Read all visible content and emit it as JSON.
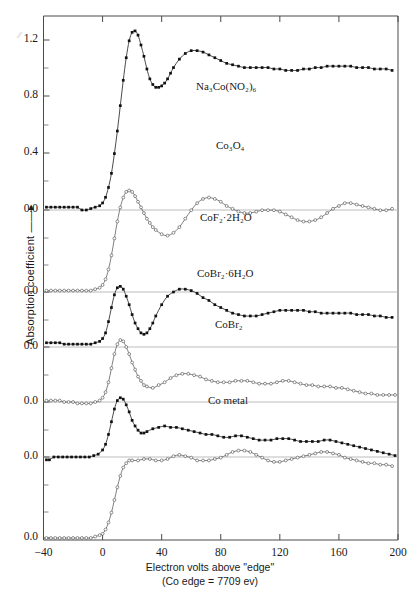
{
  "figure": {
    "axis_label_y": "Absorption coefficient ——▸",
    "axis_label_x_line1": "Electron volts above \"edge\"",
    "axis_label_x_line2": "(Co edge = 7709 ev)"
  },
  "chart_data": {
    "type": "line",
    "title": "",
    "xlabel": "Electron volts above \"edge\"",
    "ylabel": "Absorption coefficient",
    "xlim": [
      -40,
      200
    ],
    "ylim": [
      0.0,
      1.4
    ],
    "xticks": [
      -40,
      0,
      40,
      80,
      120,
      160,
      200
    ],
    "xticklabels": [
      "−40",
      "0",
      "40",
      "80",
      "120",
      "160",
      "200"
    ],
    "yticklabels": [
      "1.2",
      "0.8",
      "0.4",
      "0.0",
      "0.0",
      "0.0",
      "0.0",
      "0.0",
      "0.0"
    ],
    "y_minor_tick_step": 0.2,
    "grid": "horizontal-baselines-only",
    "legend": "inline-annotations",
    "note": "Six XANES/EXAFS absorption spectra vertically offset; each curve has its own 0.0 baseline.",
    "series": [
      {
        "name": "Na3Co(NO2)6",
        "label": "Na₃Co(NO₂)₆",
        "marker": "filled-square",
        "baseline_value": 0.0,
        "x": [
          -38,
          -35,
          -32,
          -29,
          -26,
          -23,
          -20,
          -17,
          -14,
          -11,
          -8,
          -5,
          -2,
          0,
          2,
          4,
          6,
          8,
          10,
          12,
          14,
          16,
          18,
          20,
          22,
          24,
          26,
          28,
          30,
          32,
          34,
          36,
          38,
          40,
          42,
          44,
          46,
          48,
          52,
          56,
          60,
          64,
          68,
          72,
          76,
          80,
          84,
          88,
          92,
          96,
          100,
          104,
          108,
          112,
          116,
          120,
          124,
          128,
          132,
          136,
          140,
          144,
          148,
          152,
          156,
          160,
          164,
          168,
          172,
          176,
          180,
          184,
          188,
          192,
          196
        ],
        "y": [
          0.02,
          0.02,
          0.02,
          0.02,
          0.02,
          0.02,
          0.02,
          0.02,
          0.0,
          0.0,
          0.01,
          0.02,
          0.03,
          0.05,
          0.09,
          0.16,
          0.26,
          0.4,
          0.56,
          0.74,
          0.92,
          1.08,
          1.2,
          1.26,
          1.27,
          1.24,
          1.17,
          1.09,
          1.0,
          0.93,
          0.89,
          0.87,
          0.87,
          0.88,
          0.9,
          0.93,
          0.97,
          1.01,
          1.07,
          1.11,
          1.13,
          1.13,
          1.12,
          1.1,
          1.08,
          1.06,
          1.04,
          1.03,
          1.02,
          1.01,
          1.01,
          1.01,
          1.01,
          1.01,
          1.0,
          1.0,
          0.99,
          0.99,
          0.99,
          1.0,
          1.0,
          1.01,
          1.01,
          1.02,
          1.02,
          1.02,
          1.02,
          1.02,
          1.01,
          1.01,
          1.01,
          1.0,
          1.0,
          1.0,
          0.99
        ]
      },
      {
        "name": "Co3O4",
        "label": "Co₃O₄",
        "marker": "open-circle",
        "baseline_value": 0.0,
        "x": [
          -38,
          -35,
          -32,
          -29,
          -26,
          -23,
          -20,
          -17,
          -14,
          -11,
          -8,
          -5,
          -2,
          0,
          2,
          4,
          6,
          8,
          10,
          12,
          14,
          16,
          18,
          20,
          22,
          24,
          26,
          28,
          30,
          32,
          34,
          36,
          40,
          44,
          48,
          52,
          56,
          60,
          64,
          68,
          72,
          76,
          80,
          84,
          88,
          92,
          96,
          100,
          104,
          108,
          112,
          116,
          120,
          124,
          128,
          132,
          136,
          140,
          144,
          148,
          152,
          156,
          160,
          164,
          168,
          172,
          176,
          180,
          184,
          188,
          192,
          196
        ],
        "y": [
          0.01,
          0.01,
          0.01,
          0.01,
          0.01,
          0.01,
          0.01,
          0.01,
          0.01,
          0.01,
          0.01,
          0.02,
          0.03,
          0.05,
          0.09,
          0.16,
          0.26,
          0.38,
          0.5,
          0.6,
          0.67,
          0.71,
          0.72,
          0.71,
          0.68,
          0.64,
          0.6,
          0.56,
          0.52,
          0.49,
          0.46,
          0.44,
          0.41,
          0.4,
          0.42,
          0.46,
          0.52,
          0.58,
          0.63,
          0.66,
          0.67,
          0.66,
          0.64,
          0.61,
          0.59,
          0.57,
          0.56,
          0.56,
          0.57,
          0.58,
          0.58,
          0.58,
          0.57,
          0.55,
          0.53,
          0.51,
          0.5,
          0.5,
          0.51,
          0.53,
          0.56,
          0.59,
          0.61,
          0.63,
          0.63,
          0.62,
          0.61,
          0.6,
          0.59,
          0.58,
          0.58,
          0.59
        ]
      },
      {
        "name": "CoF2-2H2O",
        "label": "CoF₂·2H₂O",
        "marker": "filled-square",
        "baseline_value": 0.0,
        "x": [
          -38,
          -35,
          -32,
          -29,
          -26,
          -23,
          -20,
          -17,
          -14,
          -11,
          -8,
          -5,
          -2,
          0,
          2,
          4,
          6,
          8,
          10,
          12,
          14,
          16,
          18,
          20,
          22,
          24,
          26,
          28,
          30,
          32,
          34,
          36,
          40,
          44,
          48,
          52,
          56,
          60,
          64,
          68,
          72,
          76,
          80,
          84,
          88,
          92,
          96,
          100,
          104,
          108,
          112,
          116,
          120,
          124,
          128,
          132,
          136,
          140,
          144,
          148,
          152,
          156,
          160,
          164,
          168,
          172,
          176,
          180,
          184,
          188,
          192,
          196
        ],
        "y": [
          0.03,
          0.03,
          0.03,
          0.03,
          0.02,
          0.02,
          0.02,
          0.02,
          0.02,
          0.02,
          0.02,
          0.03,
          0.04,
          0.06,
          0.1,
          0.18,
          0.28,
          0.37,
          0.42,
          0.43,
          0.41,
          0.36,
          0.3,
          0.23,
          0.17,
          0.13,
          0.1,
          0.09,
          0.1,
          0.13,
          0.17,
          0.22,
          0.3,
          0.36,
          0.39,
          0.41,
          0.41,
          0.4,
          0.38,
          0.35,
          0.33,
          0.3,
          0.28,
          0.26,
          0.24,
          0.23,
          0.22,
          0.22,
          0.22,
          0.23,
          0.24,
          0.25,
          0.26,
          0.26,
          0.26,
          0.26,
          0.26,
          0.25,
          0.25,
          0.24,
          0.24,
          0.24,
          0.24,
          0.24,
          0.24,
          0.23,
          0.23,
          0.23,
          0.22,
          0.22,
          0.21,
          0.21
        ]
      },
      {
        "name": "CoBr2-6H2O",
        "label": "CoBr₂·6H₂O",
        "marker": "open-circle",
        "baseline_value": 0.0,
        "x": [
          -38,
          -35,
          -32,
          -29,
          -26,
          -23,
          -20,
          -17,
          -14,
          -11,
          -8,
          -5,
          -2,
          0,
          2,
          4,
          6,
          8,
          10,
          12,
          14,
          16,
          18,
          20,
          22,
          24,
          26,
          28,
          30,
          34,
          38,
          42,
          46,
          50,
          54,
          58,
          62,
          66,
          70,
          74,
          78,
          82,
          86,
          90,
          94,
          98,
          102,
          106,
          110,
          114,
          118,
          122,
          126,
          130,
          134,
          138,
          142,
          146,
          150,
          154,
          158,
          162,
          166,
          170,
          174,
          178,
          182,
          186,
          190,
          194,
          198
        ],
        "y": [
          0.01,
          0.01,
          0.01,
          0.01,
          0.0,
          0.0,
          0.0,
          -0.01,
          -0.01,
          -0.01,
          -0.01,
          0.0,
          0.01,
          0.03,
          0.07,
          0.14,
          0.24,
          0.34,
          0.41,
          0.44,
          0.43,
          0.39,
          0.34,
          0.28,
          0.23,
          0.18,
          0.15,
          0.12,
          0.11,
          0.1,
          0.12,
          0.14,
          0.17,
          0.19,
          0.2,
          0.2,
          0.19,
          0.18,
          0.16,
          0.15,
          0.14,
          0.14,
          0.14,
          0.15,
          0.15,
          0.15,
          0.14,
          0.13,
          0.13,
          0.13,
          0.14,
          0.15,
          0.15,
          0.14,
          0.13,
          0.12,
          0.12,
          0.11,
          0.11,
          0.11,
          0.1,
          0.1,
          0.09,
          0.08,
          0.07,
          0.06,
          0.06,
          0.05,
          0.05,
          0.05,
          0.05
        ]
      },
      {
        "name": "CoBr2",
        "label": "CoBr₂",
        "marker": "filled-square",
        "baseline_value": 0.0,
        "x": [
          -38,
          -36,
          -33,
          -30,
          -27,
          -24,
          -21,
          -18,
          -15,
          -12,
          -9,
          -6,
          -3,
          0,
          2,
          4,
          6,
          8,
          10,
          12,
          14,
          16,
          18,
          20,
          22,
          24,
          26,
          28,
          30,
          34,
          38,
          42,
          46,
          50,
          54,
          58,
          62,
          66,
          70,
          74,
          78,
          82,
          86,
          90,
          94,
          98,
          102,
          106,
          110,
          114,
          118,
          122,
          126,
          130,
          134,
          138,
          142,
          146,
          150,
          154,
          158,
          162,
          166,
          170,
          174,
          178,
          182,
          186,
          190,
          194,
          198
        ],
        "y": [
          -0.02,
          -0.02,
          0.0,
          0.0,
          0.0,
          0.0,
          0.0,
          0.0,
          0.0,
          0.0,
          0.0,
          0.01,
          0.02,
          0.05,
          0.09,
          0.16,
          0.25,
          0.34,
          0.4,
          0.42,
          0.41,
          0.37,
          0.32,
          0.26,
          0.22,
          0.19,
          0.17,
          0.17,
          0.18,
          0.2,
          0.21,
          0.22,
          0.21,
          0.21,
          0.2,
          0.19,
          0.18,
          0.17,
          0.16,
          0.16,
          0.15,
          0.14,
          0.14,
          0.15,
          0.15,
          0.14,
          0.13,
          0.12,
          0.12,
          0.12,
          0.13,
          0.13,
          0.13,
          0.12,
          0.11,
          0.11,
          0.11,
          0.11,
          0.12,
          0.12,
          0.11,
          0.1,
          0.09,
          0.08,
          0.07,
          0.06,
          0.05,
          0.04,
          0.03,
          0.02,
          0.01
        ]
      },
      {
        "name": "Co metal",
        "label": "Co metal",
        "marker": "open-circle",
        "baseline_value": 0.0,
        "x": [
          -38,
          -35,
          -32,
          -29,
          -26,
          -23,
          -20,
          -17,
          -14,
          -11,
          -8,
          -5,
          -2,
          0,
          2,
          4,
          6,
          8,
          10,
          12,
          14,
          16,
          18,
          20,
          24,
          28,
          32,
          36,
          40,
          44,
          48,
          52,
          56,
          60,
          64,
          68,
          72,
          76,
          80,
          84,
          88,
          92,
          96,
          100,
          104,
          108,
          112,
          116,
          120,
          124,
          128,
          132,
          136,
          140,
          144,
          148,
          152,
          156,
          160,
          164,
          168,
          172,
          176,
          180,
          184,
          188,
          192,
          196
        ],
        "y": [
          0.0,
          0.0,
          0.0,
          0.0,
          0.0,
          0.0,
          0.0,
          0.0,
          0.0,
          0.0,
          0.0,
          0.01,
          0.02,
          0.03,
          0.06,
          0.11,
          0.18,
          0.27,
          0.36,
          0.44,
          0.5,
          0.53,
          0.55,
          0.55,
          0.55,
          0.56,
          0.56,
          0.55,
          0.55,
          0.56,
          0.58,
          0.59,
          0.58,
          0.57,
          0.55,
          0.55,
          0.55,
          0.56,
          0.57,
          0.59,
          0.61,
          0.62,
          0.62,
          0.61,
          0.59,
          0.57,
          0.55,
          0.54,
          0.54,
          0.55,
          0.56,
          0.57,
          0.58,
          0.59,
          0.6,
          0.61,
          0.61,
          0.6,
          0.59,
          0.57,
          0.56,
          0.55,
          0.54,
          0.53,
          0.53,
          0.52,
          0.52,
          0.51
        ]
      }
    ]
  },
  "axes": {
    "xticks": [
      {
        "value": -40,
        "label": "−40"
      },
      {
        "value": 0,
        "label": "0"
      },
      {
        "value": 40,
        "label": "40"
      },
      {
        "value": 80,
        "label": "80"
      },
      {
        "value": 120,
        "label": "120"
      },
      {
        "value": 160,
        "label": "160"
      },
      {
        "value": 200,
        "label": "200"
      }
    ],
    "yticks": [
      {
        "label": "1.2",
        "py": 40
      },
      {
        "label": "0.8",
        "py": 96
      },
      {
        "label": "0.4",
        "py": 153
      },
      {
        "label": "0.0",
        "py": 210
      },
      {
        "label": "0.0",
        "py": 292
      },
      {
        "label": "0.0",
        "py": 347
      },
      {
        "label": "0.0",
        "py": 402
      },
      {
        "label": "0.0",
        "py": 457
      },
      {
        "label": "0.0",
        "py": 538
      }
    ]
  },
  "annotations": [
    {
      "id": "na3co",
      "text": "Na₃Co(NO₂)₆",
      "x": 196,
      "y": 80
    },
    {
      "id": "co3o4",
      "text": "Co₃O₄",
      "x": 216,
      "y": 139
    },
    {
      "id": "cof2",
      "text": "CoF₂·2H₂O",
      "x": 200,
      "y": 211
    },
    {
      "id": "cobr26",
      "text": "CoBr₂·6H₂O",
      "x": 197,
      "y": 267
    },
    {
      "id": "cobr2",
      "text": "CoBr₂",
      "x": 215,
      "y": 318
    },
    {
      "id": "cometal",
      "text": "Co metal",
      "x": 208,
      "y": 394
    }
  ]
}
